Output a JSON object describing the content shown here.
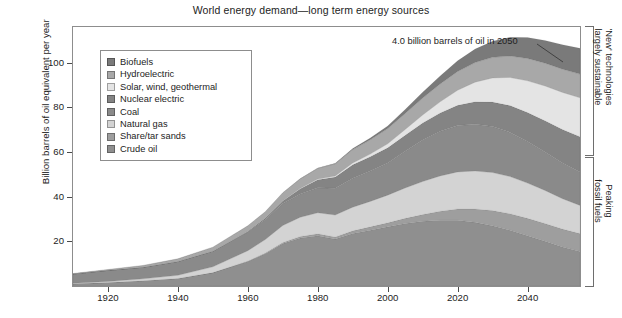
{
  "chart_data": {
    "type": "area",
    "stacked": true,
    "title": "World energy demand—long term energy sources",
    "xlabel": "",
    "ylabel": "Billion barrels of oil equivalent per year",
    "xlim": [
      1910,
      2055
    ],
    "ylim": [
      0,
      116
    ],
    "grid": false,
    "legend_position": "upper-left-inside",
    "x": [
      1910,
      1920,
      1930,
      1940,
      1950,
      1960,
      1965,
      1970,
      1975,
      1980,
      1985,
      1990,
      1995,
      2000,
      2005,
      2010,
      2015,
      2020,
      2025,
      2030,
      2035,
      2040,
      2045,
      2050,
      2055
    ],
    "series": [
      {
        "name": "Crude oil",
        "color": "#8f8f8f",
        "values": [
          1.0,
          1.6,
          2.4,
          3.4,
          6.0,
          11.0,
          14.5,
          19.0,
          21.5,
          22.5,
          21.0,
          23.5,
          25.0,
          26.5,
          28.0,
          29.0,
          29.5,
          29.5,
          28.5,
          27.0,
          25.0,
          22.5,
          20.0,
          17.5,
          15.5
        ]
      },
      {
        "name": "Share/tar sands",
        "color": "#9e9e9e",
        "values": [
          0.0,
          0.0,
          0.0,
          0.0,
          0.0,
          0.2,
          0.3,
          0.5,
          0.7,
          0.9,
          1.0,
          1.2,
          1.5,
          1.8,
          2.3,
          3.0,
          4.0,
          5.0,
          6.0,
          6.8,
          7.4,
          7.8,
          8.0,
          8.0,
          8.0
        ]
      },
      {
        "name": "Natural gas",
        "color": "#d3d3d3",
        "values": [
          0.2,
          0.4,
          0.8,
          1.4,
          2.6,
          4.6,
          6.0,
          7.6,
          8.6,
          9.4,
          9.8,
          10.6,
          11.4,
          12.4,
          13.6,
          14.8,
          15.8,
          16.6,
          17.0,
          17.0,
          16.6,
          15.8,
          14.8,
          13.6,
          12.6
        ]
      },
      {
        "name": "Coal",
        "color": "#8a8a8a",
        "values": [
          4.2,
          5.0,
          5.2,
          6.2,
          7.0,
          8.4,
          9.0,
          9.8,
          10.4,
          11.2,
          12.0,
          13.0,
          13.6,
          14.4,
          16.4,
          18.6,
          20.0,
          20.8,
          21.0,
          20.6,
          19.8,
          18.6,
          17.2,
          16.0,
          15.0
        ]
      },
      {
        "name": "Nuclear electric",
        "color": "#848484",
        "values": [
          0.0,
          0.0,
          0.0,
          0.0,
          0.0,
          0.2,
          0.5,
          1.2,
          2.4,
          3.6,
          5.0,
          6.0,
          6.4,
          6.8,
          7.2,
          7.6,
          8.2,
          9.0,
          10.0,
          11.0,
          12.0,
          13.0,
          14.0,
          15.0,
          15.8
        ]
      },
      {
        "name": "Solar, wind, geothermal",
        "color": "#e4e4e4",
        "values": [
          0.0,
          0.0,
          0.0,
          0.0,
          0.0,
          0.0,
          0.0,
          0.1,
          0.2,
          0.3,
          0.5,
          0.8,
          1.2,
          1.8,
          2.6,
          3.6,
          5.0,
          6.8,
          8.8,
          10.8,
          12.6,
          14.2,
          15.6,
          16.6,
          17.4
        ]
      },
      {
        "name": "Hydroelectric",
        "color": "#a8a8a8",
        "values": [
          0.2,
          0.4,
          0.8,
          1.2,
          1.8,
          2.6,
          3.0,
          3.6,
          4.2,
          4.8,
          5.4,
          6.0,
          6.4,
          6.8,
          7.2,
          7.6,
          8.0,
          8.4,
          8.8,
          9.2,
          9.6,
          10.0,
          10.2,
          10.4,
          10.6
        ]
      },
      {
        "name": "Biofuels",
        "color": "#7a7a7a",
        "values": [
          0.0,
          0.0,
          0.0,
          0.0,
          0.0,
          0.0,
          0.0,
          0.0,
          0.1,
          0.2,
          0.3,
          0.5,
          0.8,
          1.2,
          1.8,
          2.6,
          3.6,
          4.8,
          6.0,
          7.2,
          8.4,
          9.4,
          10.2,
          11.0,
          11.6
        ]
      }
    ],
    "stack_order_bottom_to_top": [
      "Crude oil",
      "Share/tar sands",
      "Natural gas",
      "Coal",
      "Nuclear electric",
      "Solar, wind, geothermal",
      "Hydroelectric",
      "Biofuels"
    ],
    "y_ticks": [
      20,
      40,
      60,
      80,
      100
    ],
    "x_ticks": [
      1920,
      1940,
      1960,
      1980,
      2000,
      2020,
      2040
    ],
    "annotations": [
      {
        "text": "4.0 billion barrels of oil in 2050",
        "x": 2050,
        "y": 108
      }
    ]
  },
  "legend": {
    "items": [
      {
        "label": "Biofuels",
        "color": "#7a7a7a"
      },
      {
        "label": "Hydroelectric",
        "color": "#a8a8a8"
      },
      {
        "label": "Solar, wind, geothermal",
        "color": "#e4e4e4"
      },
      {
        "label": "Nuclear electric",
        "color": "#848484"
      },
      {
        "label": "Coal",
        "color": "#8a8a8a"
      },
      {
        "label": "Natural gas",
        "color": "#d3d3d3"
      },
      {
        "label": "Share/tar sands",
        "color": "#9e9e9e"
      },
      {
        "label": "Crude oil",
        "color": "#8f8f8f"
      }
    ]
  },
  "brackets": [
    {
      "label_line1": "'New' technologies",
      "label_line2": "largely sustainable"
    },
    {
      "label_line1": "Peaking",
      "label_line2": "fossil fuels"
    }
  ]
}
